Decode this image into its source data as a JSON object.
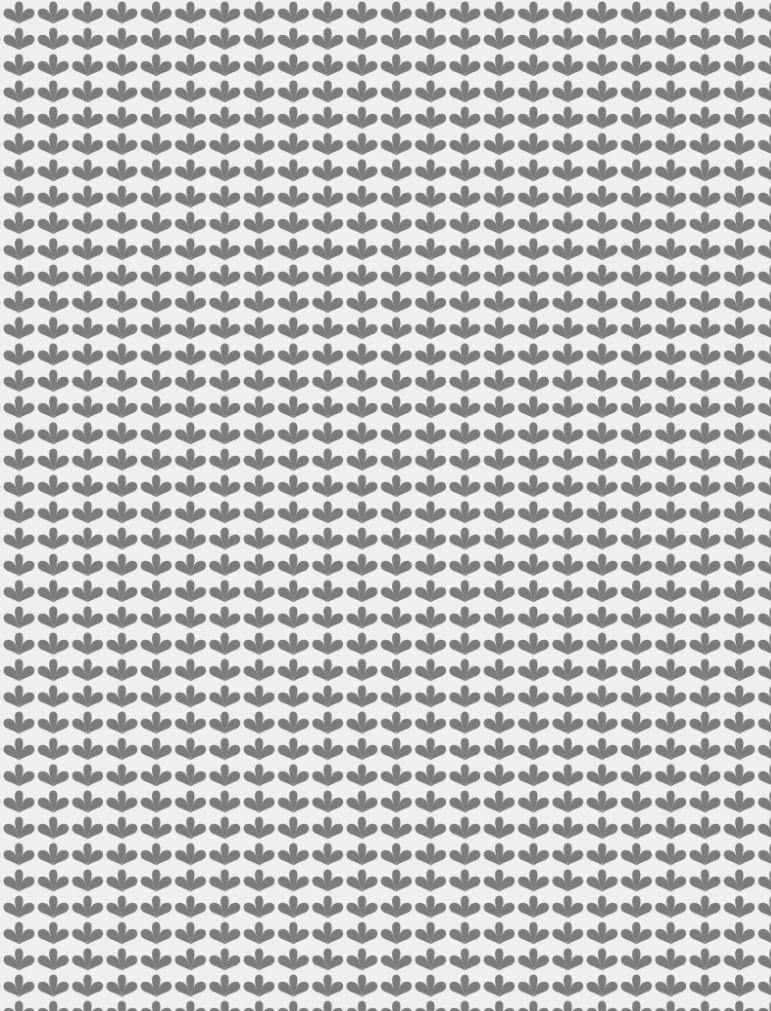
{
  "pattern": {
    "motif": "three-petal-fan-icon",
    "colors": {
      "background": "#efefef",
      "motif": "#7b7b7b"
    },
    "tile": {
      "width": 34.3,
      "height": 26.3
    },
    "origin": {
      "x": 2,
      "y": 0
    },
    "columns": 23,
    "rows": 39
  }
}
